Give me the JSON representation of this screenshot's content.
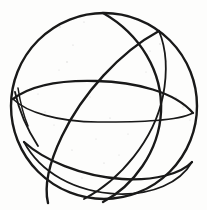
{
  "figure": {
    "title": "Sphere with great circles",
    "kind": "hand-drawn line sketch",
    "background_color": "#fdfdfc",
    "ink_color": "#191919",
    "speckle_color": "#cfcfcf",
    "canvas": {
      "width": 207,
      "height": 210
    }
  },
  "geometry": {
    "sphere_outline": {
      "name": "outer-circle",
      "center_x": 104,
      "center_y": 106,
      "radius": 93,
      "stroke_width": 2.4
    },
    "curves": [
      {
        "name": "equator-ellipse",
        "label": "equator",
        "stroke_width": 2.3,
        "path": "M 13 99 C 30 86, 60 80, 96 81 C 136 82, 175 92, 193 113"
      },
      {
        "name": "equator-ellipse-back",
        "label": "equator far side",
        "stroke_width": 1.6,
        "path": "M 13 99 C 26 112, 58 122, 98 122 C 141 122, 178 121, 193 113"
      },
      {
        "name": "lower-latitude-ellipse",
        "label": "lower latitude circle",
        "stroke_width": 2.3,
        "path": "M 24 142 C 44 160, 80 176, 122 179 C 154 181, 181 174, 192 162"
      },
      {
        "name": "lower-latitude-ellipse-back",
        "label": "lower latitude far side",
        "stroke_width": 1.7,
        "path": "M 24 142 C 40 172, 74 192, 118 194 C 152 195, 180 183, 192 162"
      },
      {
        "name": "meridian-ellipse",
        "label": "vertical meridian",
        "stroke_width": 2.4,
        "path": "M 103 13 C 140 34, 163 72, 161 112 C 159 152, 133 186, 103 202"
      },
      {
        "name": "tilted-great-circle-front",
        "label": "tilted great circle front arc",
        "stroke_width": 2.4,
        "path": "M 159 31 C 120 52, 82 94, 62 136 C 49 163, 44 186, 48 203"
      },
      {
        "name": "tilted-great-circle-back",
        "label": "tilted great circle back arc",
        "stroke_width": 1.8,
        "path": "M 159 31 C 166 48, 168 70, 163 96 C 154 140, 120 180, 84 199"
      },
      {
        "name": "left-cusp-arc",
        "label": "left convergence arc",
        "stroke_width": 1.8,
        "path": "M 15 92 C 18 106, 25 126, 38 146"
      },
      {
        "name": "left-cusp-arc-inner",
        "label": "left convergence inner arc",
        "stroke_width": 1.5,
        "path": "M 18 88 C 20 101, 23 114, 28 126"
      }
    ],
    "speckles": [
      {
        "x": 60,
        "y": 27,
        "r": 0.7
      },
      {
        "x": 84,
        "y": 22,
        "r": 0.6
      },
      {
        "x": 73,
        "y": 45,
        "r": 0.6
      },
      {
        "x": 67,
        "y": 62,
        "r": 0.7
      },
      {
        "x": 59,
        "y": 70,
        "r": 0.5
      },
      {
        "x": 150,
        "y": 51,
        "r": 0.6
      },
      {
        "x": 160,
        "y": 44,
        "r": 0.7
      },
      {
        "x": 166,
        "y": 61,
        "r": 0.6
      },
      {
        "x": 146,
        "y": 72,
        "r": 0.5
      },
      {
        "x": 176,
        "y": 97,
        "r": 0.6
      },
      {
        "x": 183,
        "y": 107,
        "r": 0.7
      },
      {
        "x": 190,
        "y": 120,
        "r": 0.5
      },
      {
        "x": 45,
        "y": 112,
        "r": 0.6
      },
      {
        "x": 54,
        "y": 125,
        "r": 0.5
      },
      {
        "x": 72,
        "y": 150,
        "r": 0.6
      },
      {
        "x": 96,
        "y": 139,
        "r": 0.5
      },
      {
        "x": 110,
        "y": 118,
        "r": 0.6
      },
      {
        "x": 128,
        "y": 134,
        "r": 0.5
      },
      {
        "x": 104,
        "y": 163,
        "r": 0.6
      },
      {
        "x": 119,
        "y": 155,
        "r": 0.5
      },
      {
        "x": 140,
        "y": 168,
        "r": 0.6
      },
      {
        "x": 38,
        "y": 94,
        "r": 0.5
      },
      {
        "x": 90,
        "y": 97,
        "r": 0.5
      },
      {
        "x": 155,
        "y": 122,
        "r": 0.5
      },
      {
        "x": 82,
        "y": 178,
        "r": 0.5
      }
    ]
  }
}
